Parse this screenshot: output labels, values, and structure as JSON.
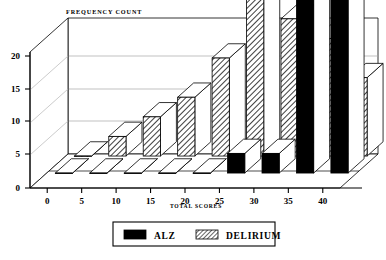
{
  "chart_data": {
    "type": "bar",
    "title": "FREQUENCY COUNT",
    "xlabel": "TOTAL SCORES",
    "ylabel": "",
    "categories": [
      "0",
      "5",
      "10",
      "15",
      "20",
      "25",
      "30",
      "35",
      "40"
    ],
    "series": [
      {
        "name": "ALZ",
        "values": [
          0,
          0,
          0,
          0,
          0,
          1,
          1,
          13,
          19
        ]
      },
      {
        "name": "DELIRIUM",
        "values": [
          0,
          1,
          2,
          3,
          5,
          17,
          7,
          6,
          4
        ]
      }
    ],
    "ylim": [
      0,
      20
    ],
    "yticks": [
      "0",
      "5",
      "10",
      "15",
      "20"
    ],
    "grid": true,
    "legend_position": "bottom",
    "projection": "3d",
    "colors": {
      "alz": "#000000",
      "delirium": "#ffffff",
      "axis": "#000000",
      "grid": "#9a9a9a"
    }
  },
  "legend": {
    "items": [
      {
        "label": "ALZ",
        "swatch": "solid-black-swatch"
      },
      {
        "label": "DELIRIUM",
        "swatch": "hatched-swatch"
      }
    ]
  }
}
